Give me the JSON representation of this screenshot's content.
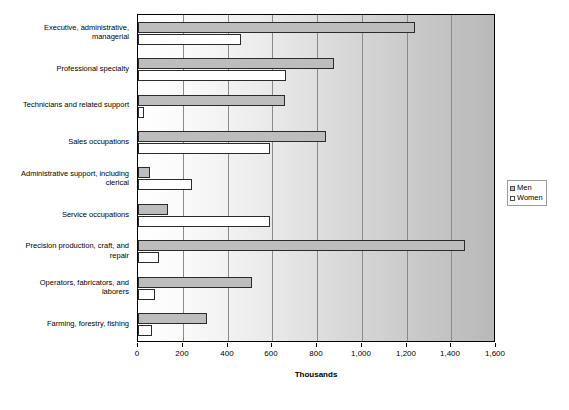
{
  "chart_data": {
    "type": "bar",
    "orientation": "horizontal",
    "title": "",
    "xlabel": "Thousands",
    "ylabel": "",
    "xlim": [
      0,
      1600
    ],
    "xticks": [
      0,
      200,
      400,
      600,
      800,
      1000,
      1200,
      1400,
      1600
    ],
    "xtick_labels": [
      "0",
      "200",
      "400",
      "600",
      "800",
      "1,000",
      "1,200",
      "1,400",
      "1,600"
    ],
    "grid": true,
    "grid_axis": "x",
    "legend_position": "right",
    "categories": [
      "Executive, administrative, managerial",
      "Professional specialty",
      "Technicians and related support",
      "Sales occupations",
      "Administrative support, including clerical",
      "Service occupations",
      "Precision production, craft, and repair",
      "Operators, fabricators, and laborers",
      "Farming, forestry, fishing"
    ],
    "series": [
      {
        "name": "Men",
        "color": "#bdbdbd",
        "values": [
          1240,
          875,
          655,
          840,
          52,
          135,
          1460,
          510,
          308
        ]
      },
      {
        "name": "Women",
        "color": "#ffffff",
        "values": [
          460,
          660,
          25,
          592,
          240,
          590,
          95,
          75,
          62
        ]
      }
    ]
  },
  "category_labels": [
    [
      "Executive, administrative,",
      "managerial"
    ],
    [
      "Professional specialty"
    ],
    [
      "Technicians and related support"
    ],
    [
      "Sales occupations"
    ],
    [
      "Administrative support, including",
      "clerical"
    ],
    [
      "Service occupations"
    ],
    [
      "Precision production, craft, and",
      "repair"
    ],
    [
      "Operators, fabricators, and",
      "laborers"
    ],
    [
      "Farming, forestry, fishing"
    ]
  ],
  "legend": {
    "items": [
      {
        "label": "Men",
        "swatch": "men"
      },
      {
        "label": "Women",
        "swatch": "women"
      }
    ]
  },
  "axis": {
    "x_title": "Thousands"
  },
  "colors": {
    "men_bar": "#bdbdbd",
    "women_bar": "#ffffff",
    "bar_outline": "#2b2b2b",
    "gridline": "#8a8a8a",
    "plot_border": "#000000"
  }
}
